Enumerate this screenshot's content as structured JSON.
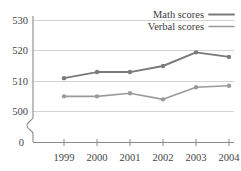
{
  "chart_data": {
    "type": "line",
    "title": "",
    "xlabel": "",
    "ylabel": "",
    "categories": [
      "1999",
      "2000",
      "2001",
      "2002",
      "2003",
      "2004"
    ],
    "x": [
      1999,
      2000,
      2001,
      2002,
      2003,
      2004
    ],
    "series": [
      {
        "name": "Math scores",
        "color": "#7a7a7a",
        "values": [
          511,
          513,
          513,
          515,
          519.5,
          518
        ]
      },
      {
        "name": "Verbal scores",
        "color": "#9a9a9a",
        "values": [
          505,
          505,
          506,
          504,
          508,
          508.5
        ]
      }
    ],
    "ylim": [
      500,
      530
    ],
    "yticks": [
      "530",
      "520",
      "510",
      "500",
      "0"
    ],
    "ytick_values": [
      530,
      520,
      510,
      500,
      0
    ],
    "xticks": [
      "1999",
      "2000",
      "2001",
      "2002",
      "2003",
      "2004"
    ],
    "grid": true,
    "axis_break": true,
    "legend_position": "top-right",
    "legend": [
      {
        "label": "Math scores",
        "color": "#7a7a7a"
      },
      {
        "label": "Verbal scores",
        "color": "#9a9a9a"
      }
    ]
  },
  "axis": {
    "y_label_530": "530",
    "y_label_520": "520",
    "y_label_510": "510",
    "y_label_500": "500",
    "y_label_0": "0",
    "x_label_1999": "1999",
    "x_label_2000": "2000",
    "x_label_2001": "2001",
    "x_label_2002": "2002",
    "x_label_2003": "2003",
    "x_label_2004": "2004"
  },
  "legend": {
    "math_label": "Math scores",
    "verbal_label": "Verbal scores"
  },
  "colors": {
    "math": "#7a7a7a",
    "verbal": "#9a9a9a",
    "grid": "#c8c8c8",
    "axis": "#8a8a8a",
    "text": "#3a3a3a",
    "background": "#ffffff"
  }
}
